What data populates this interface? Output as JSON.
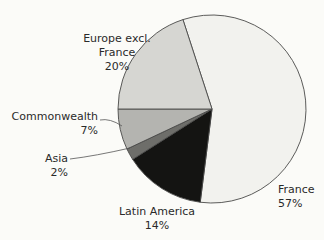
{
  "chart_data": {
    "type": "pie",
    "title": "",
    "categories": [
      "France",
      "Latin America",
      "Asia",
      "Commonwealth",
      "Europe excl. France"
    ],
    "values": [
      57,
      14,
      2,
      7,
      20
    ],
    "unit": "%",
    "start_angle_deg": 342,
    "direction": "clockwise",
    "colors": [
      "#f2f2ee",
      "#141412",
      "#6e6e6a",
      "#b4b4b0",
      "#d6d6d2"
    ],
    "labels": [
      {
        "name": "France",
        "value": "57%"
      },
      {
        "name": "Latin America",
        "value": "14%"
      },
      {
        "name": "Asia",
        "value": "2%"
      },
      {
        "name": "Commonwealth",
        "value": "7%"
      },
      {
        "name": "Europe excl. France",
        "value": "20%"
      }
    ],
    "legend": "none (direct labels)"
  },
  "labels": {
    "france_name": "France",
    "france_value": "57%",
    "latam_name": "Latin America",
    "latam_value": "14%",
    "asia_name": "Asia",
    "asia_value": "2%",
    "commonwealth_name": "Commonwealth",
    "commonwealth_value": "7%",
    "europe_name_1": "Europe excl.",
    "europe_name_2": "France",
    "europe_value": "20%"
  }
}
